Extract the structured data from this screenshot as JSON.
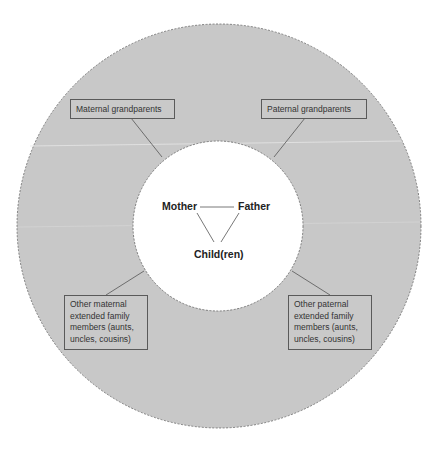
{
  "diagram": {
    "title": "",
    "colors": {
      "ring_fill": "#c8c8c8",
      "inner_fill": "#ffffff",
      "border": "#666666",
      "line": "#555555",
      "text": "#222222"
    },
    "nuclear_family": {
      "mother": "Mother",
      "father": "Father",
      "children": "Child(ren)"
    },
    "extended_family": {
      "maternal_grandparents": "Maternal grandparents",
      "paternal_grandparents": "Paternal grandparents",
      "other_maternal": "Other maternal extended family members (aunts, uncles, cousins)",
      "other_paternal": "Other paternal extended family members (aunts, uncles, cousins)"
    }
  }
}
